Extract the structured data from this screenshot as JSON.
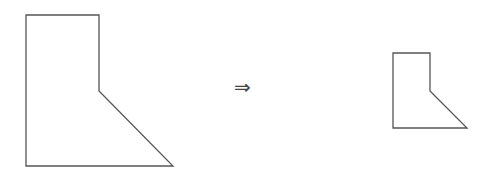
{
  "diagram": {
    "type": "shape-scaling",
    "stroke_color": "#555555",
    "original_shape": {
      "label": "original",
      "points": [
        [
          26,
          15
        ],
        [
          99,
          15
        ],
        [
          99,
          91
        ],
        [
          173,
          166
        ],
        [
          26,
          166
        ]
      ]
    },
    "scaled_shape": {
      "label": "scaled",
      "points": [
        [
          393,
          53
        ],
        [
          430,
          53
        ],
        [
          430,
          91
        ],
        [
          467,
          128
        ],
        [
          393,
          128
        ]
      ]
    },
    "arrow": {
      "symbol": "⇒",
      "x": 234,
      "y": 77
    }
  }
}
